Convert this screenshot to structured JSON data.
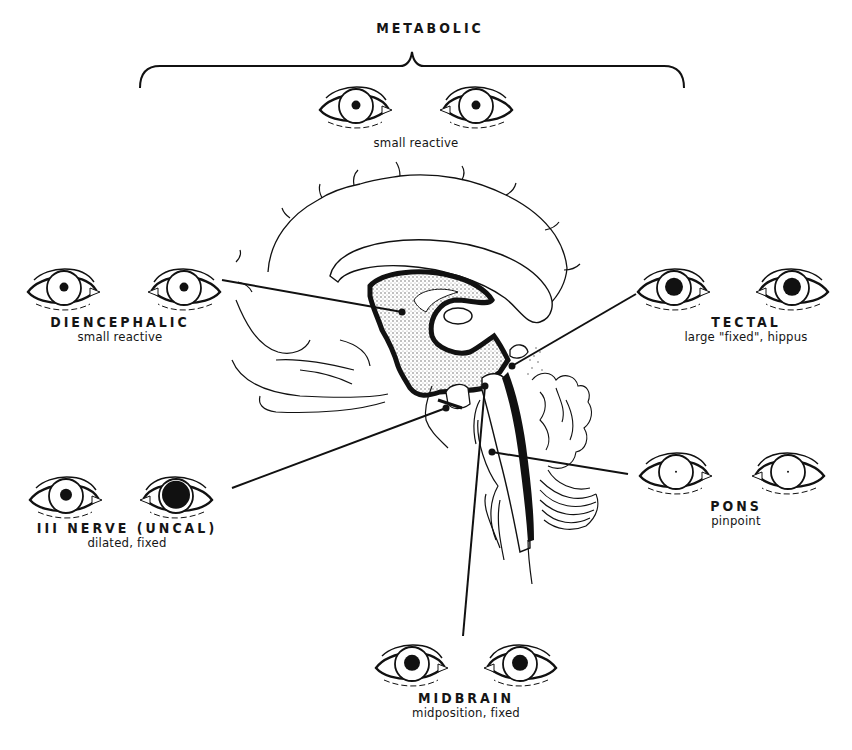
{
  "diagram": {
    "colors": {
      "ink": "#111111",
      "background": "#ffffff",
      "stipple": "#8a8a8a"
    },
    "brain": {
      "view": "mid-sagittal section",
      "icon": "brain-sagittal-section"
    },
    "groups": [
      {
        "id": "metabolic",
        "title": "METABOLIC",
        "description": "small reactive",
        "pupil_left": 4.5,
        "pupil_right": 4.5,
        "bracket": true
      },
      {
        "id": "diencephalic",
        "title": "DIENCEPHALIC",
        "description": "small reactive",
        "pupil_left": 4.5,
        "pupil_right": 4.5
      },
      {
        "id": "tectal",
        "title": "TECTAL",
        "description": "large \"fixed\", hippus",
        "pupil_left": 9,
        "pupil_right": 9
      },
      {
        "id": "iii-nerve",
        "title": "III NERVE (UNCAL)",
        "description": "dilated, fixed",
        "pupil_left": 6,
        "pupil_right": 14
      },
      {
        "id": "pons",
        "title": "PONS",
        "description": "pinpoint",
        "pupil_left": 1,
        "pupil_right": 1
      },
      {
        "id": "midbrain",
        "title": "MIDBRAIN",
        "description": "midposition, fixed",
        "pupil_left": 8,
        "pupil_right": 8
      }
    ]
  }
}
